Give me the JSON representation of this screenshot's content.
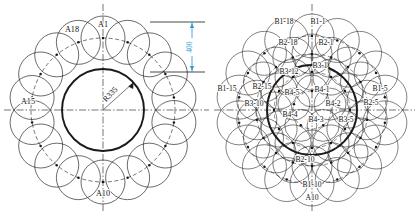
{
  "figure": {
    "background_color": "#ffffff",
    "line_color": "#1a1a1a",
    "dimension_color": "#3b9ed4"
  },
  "left_diagram": {
    "name": "single-ring-layout",
    "center": {
      "x": 103,
      "y": 110
    },
    "bold_inner_circle": {
      "radius": 41,
      "label": "R335"
    },
    "pitch_circle": {
      "radius": 72,
      "style": "dashed"
    },
    "ring": {
      "count": 18,
      "circle_radius": 22,
      "start_angle_deg": -90
    },
    "labels": [
      {
        "text": "A1",
        "x": 103,
        "y": 27,
        "anchor": "middle"
      },
      {
        "text": "A18",
        "x": 72,
        "y": 32,
        "anchor": "middle"
      },
      {
        "text": "A15",
        "x": 28,
        "y": 104,
        "anchor": "middle"
      },
      {
        "text": "A10",
        "x": 103,
        "y": 196,
        "anchor": "middle"
      }
    ],
    "radius_dimension": {
      "text": "R335",
      "x": 112,
      "y": 96,
      "rotation": -46
    },
    "vertical_dimension": {
      "value": "400",
      "color": "#3b9ed4",
      "top_y": 22,
      "bottom_y": 72,
      "x": 192,
      "extension_left_x": 150
    },
    "centerlines": {
      "vertical": true,
      "horizontal": true,
      "style": "dash-dot"
    }
  },
  "right_diagram": {
    "name": "multi-ring-layout",
    "center": {
      "x": 312,
      "y": 110
    },
    "bold_circle": {
      "radius": 45
    },
    "rings": [
      {
        "name": "B1",
        "count": 18,
        "pitch_radius": 74,
        "circle_radius": 22,
        "start_angle_deg": -90
      },
      {
        "name": "B2",
        "count": 18,
        "pitch_radius": 56,
        "circle_radius": 20,
        "start_angle_deg": -90
      },
      {
        "name": "B3",
        "count": 12,
        "pitch_radius": 38,
        "circle_radius": 18,
        "start_angle_deg": -90
      },
      {
        "name": "B4",
        "count": 5,
        "pitch_radius": 19,
        "circle_radius": 16,
        "start_angle_deg": -90
      }
    ],
    "labels": [
      {
        "text": "B1-18",
        "x": 284,
        "y": 24
      },
      {
        "text": "B1-1",
        "x": 318,
        "y": 24
      },
      {
        "text": "B2-18",
        "x": 288,
        "y": 45
      },
      {
        "text": "B2-1",
        "x": 326,
        "y": 45
      },
      {
        "text": "B3-1",
        "x": 320,
        "y": 68
      },
      {
        "text": "B3-12",
        "x": 289,
        "y": 74
      },
      {
        "text": "B1-15",
        "x": 227,
        "y": 91
      },
      {
        "text": "B2-15",
        "x": 262,
        "y": 89
      },
      {
        "text": "B1-5",
        "x": 380,
        "y": 91
      },
      {
        "text": "B2-5",
        "x": 371,
        "y": 105
      },
      {
        "text": "B3-10",
        "x": 254,
        "y": 106
      },
      {
        "text": "B4-5",
        "x": 292,
        "y": 95
      },
      {
        "text": "B4-1",
        "x": 322,
        "y": 92
      },
      {
        "text": "B4-2",
        "x": 333,
        "y": 106
      },
      {
        "text": "B4-4",
        "x": 290,
        "y": 117
      },
      {
        "text": "B4-3",
        "x": 316,
        "y": 122
      },
      {
        "text": "B3-5",
        "x": 346,
        "y": 122
      },
      {
        "text": "B2-10",
        "x": 305,
        "y": 162
      },
      {
        "text": "B1-10",
        "x": 312,
        "y": 187
      },
      {
        "text": "A10",
        "x": 312,
        "y": 200
      }
    ],
    "centerlines": {
      "vertical": true,
      "horizontal": true,
      "style": "dash-dot"
    }
  }
}
